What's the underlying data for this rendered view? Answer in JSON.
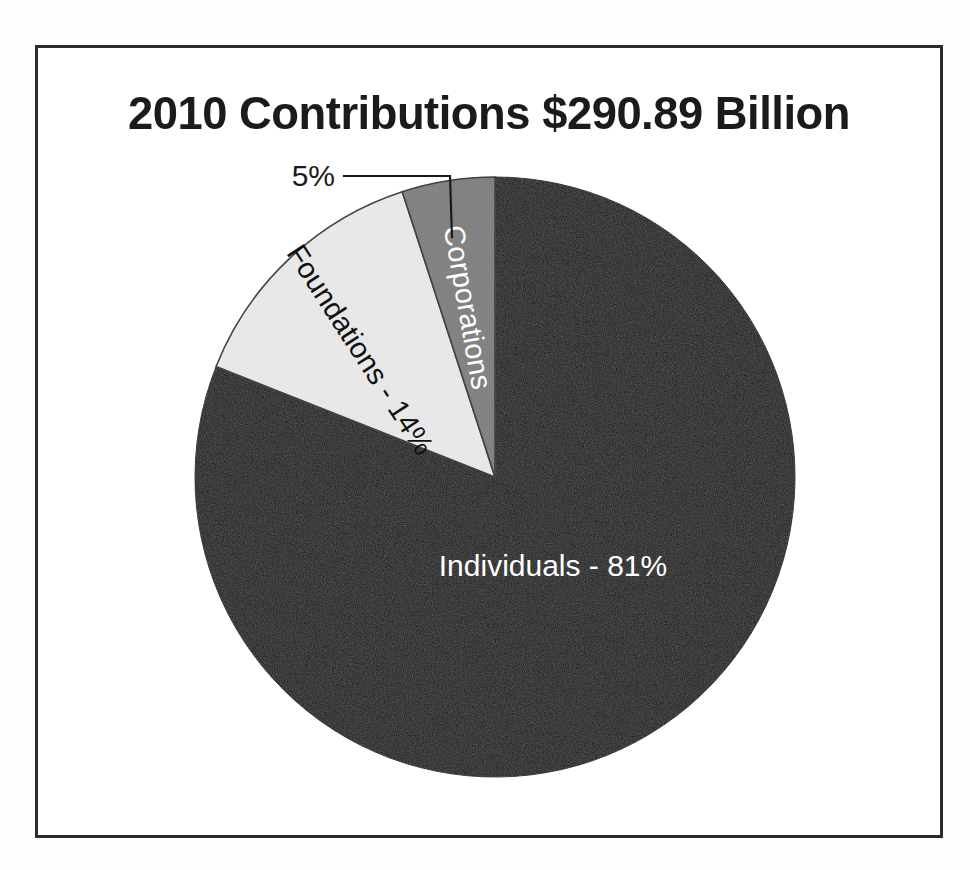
{
  "document": {
    "background_color": "#fdfdfd",
    "frame_color": "#2b2b2b"
  },
  "chart_title": "2010 Contributions $290.89 Billion",
  "callout": {
    "label": "5%",
    "points_to": "Corporations"
  },
  "labels": {
    "individuals": "Individuals - 81%",
    "foundations": "Foundations - 14%",
    "corporations": "Corporations"
  },
  "chart_data": {
    "type": "pie",
    "title": "2010 Contributions $290.89 Billion",
    "subtitle": "",
    "xlabel": "",
    "ylabel": "",
    "total_label": "$290.89 Billion",
    "total_value": 290.89,
    "units": "USD billions",
    "year": 2010,
    "legend_position": "none",
    "grid": false,
    "labels_on_slices": true,
    "start_angle_deg": 0,
    "direction": "clockwise",
    "categories": [
      "Individuals",
      "Foundations",
      "Corporations"
    ],
    "values": [
      81,
      14,
      5
    ],
    "value_labels": [
      "81%",
      "14%",
      "5%"
    ],
    "colors": [
      "#151515",
      "#e9e9e9",
      "#808080"
    ],
    "slices": [
      {
        "name": "Individuals",
        "percent": 81,
        "label": "Individuals - 81%",
        "color": "#151515",
        "label_color": "#ffffff",
        "label_rotation_deg": 0,
        "label_placement": "inside"
      },
      {
        "name": "Foundations",
        "percent": 14,
        "label": "Foundations - 14%",
        "color": "#e9e9e9",
        "label_color": "#111111",
        "label_rotation_deg": 57,
        "label_placement": "inside"
      },
      {
        "name": "Corporations",
        "percent": 5,
        "label": "Corporations",
        "color": "#808080",
        "label_color": "#ffffff",
        "label_rotation_deg": 90,
        "label_placement": "inside",
        "callout_label": "5%",
        "callout_placement": "outside-left"
      }
    ]
  }
}
